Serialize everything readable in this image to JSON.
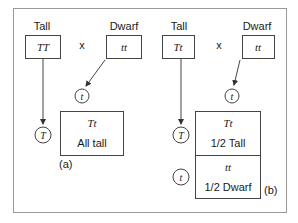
{
  "panel_a": {
    "parent1": {
      "label": "Tall",
      "genotype": "TT"
    },
    "cross_symbol": "x",
    "parent2": {
      "label": "Dwarf",
      "genotype": "tt"
    },
    "gamete_parent1": "T",
    "gamete_parent2": "t",
    "offspring": {
      "genotype": "Tt",
      "phenotype": "All tall"
    },
    "panel_label": "(a)"
  },
  "panel_b": {
    "parent1": {
      "label": "Tall",
      "genotype": "Tt"
    },
    "cross_symbol": "x",
    "parent2": {
      "label": "Dwarf",
      "genotype": "tt"
    },
    "gamete_parent2": "t",
    "gametes_parent1": [
      "T",
      "t"
    ],
    "offspring": [
      {
        "genotype": "Tt",
        "phenotype": "1/2 Tall"
      },
      {
        "genotype": "tt",
        "phenotype": "1/2 Dwarf"
      }
    ],
    "panel_label": "(b)"
  },
  "colors": {
    "line": "#555555",
    "text": "#1a1a1a",
    "frame": "#9a9a9a"
  }
}
